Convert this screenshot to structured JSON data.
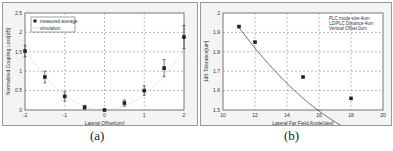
{
  "figure": {
    "captions": [
      "(a)",
      "(b)"
    ]
  },
  "chart_data": [
    {
      "type": "scatter",
      "panel": "(a)",
      "title": "",
      "xlabel": "Lateral Offset[um]",
      "ylabel": "Normalized Coupling Loss[dB]",
      "xlim": [
        -2,
        2
      ],
      "ylim": [
        0,
        2.5
      ],
      "xticks": [
        "-2",
        "-1",
        "0",
        "1",
        "2"
      ],
      "yticks": [
        "0",
        "0.5",
        "1",
        "1.5",
        "2",
        "2.5"
      ],
      "grid": true,
      "legend": {
        "position": "upper-left",
        "entries": [
          "measured average",
          "simulation"
        ]
      },
      "series": [
        {
          "name": "measured average",
          "style": "square-markers-with-error-bars",
          "x": [
            -2,
            -1.5,
            -1,
            -0.5,
            0,
            0.5,
            1,
            1.5,
            2
          ],
          "y": [
            1.52,
            0.85,
            0.35,
            0.07,
            0.0,
            0.18,
            0.5,
            1.08,
            1.88
          ],
          "error": [
            0.15,
            0.15,
            0.12,
            0.05,
            0.02,
            0.08,
            0.12,
            0.22,
            0.3
          ]
        },
        {
          "name": "simulation",
          "style": "dotted-line",
          "x": [
            -2,
            -1.5,
            -1,
            -0.5,
            0,
            0.5,
            1,
            1.5,
            2
          ],
          "y": [
            1.55,
            0.9,
            0.4,
            0.1,
            0.0,
            0.1,
            0.4,
            0.9,
            1.55
          ]
        }
      ]
    },
    {
      "type": "line",
      "panel": "(b)",
      "title": "",
      "xlabel": "Lateral Far Field Angle[deg]",
      "ylabel": "1dB Tolerance[um]",
      "xlim": [
        10,
        20
      ],
      "ylim": [
        1.5,
        2
      ],
      "xticks": [
        "10",
        "12",
        "14",
        "16",
        "18",
        "20"
      ],
      "yticks": [
        "1.5",
        "1.6",
        "1.7",
        "1.8",
        "1.9",
        "2"
      ],
      "grid": true,
      "annotation": [
        "PLC mode size:4um",
        "LD/PLC Distance:4um",
        "Vertical Offset:0um"
      ],
      "series": [
        {
          "name": "1dB tolerance",
          "style": "square-markers-with-smooth-line",
          "x": [
            11,
            12,
            15,
            18
          ],
          "y": [
            1.93,
            1.85,
            1.67,
            1.56
          ]
        }
      ]
    }
  ]
}
